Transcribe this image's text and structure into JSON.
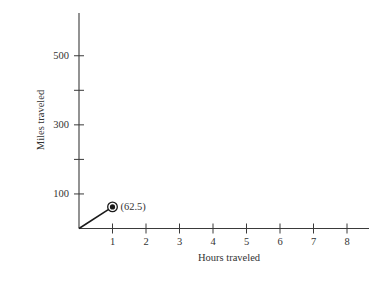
{
  "chart_data": {
    "type": "line",
    "title": "",
    "xlabel": "Hours traveled",
    "ylabel": "Miles traveled",
    "xlim": [
      0,
      8.7
    ],
    "ylim": [
      0,
      620
    ],
    "x_ticks": [
      1,
      2,
      3,
      4,
      5,
      6,
      7,
      8
    ],
    "x_tick_labels": [
      "1",
      "2",
      "3",
      "4",
      "5",
      "6",
      "7",
      "8"
    ],
    "y_ticks": [
      100,
      200,
      300,
      400,
      500
    ],
    "y_tick_labels": [
      "100",
      "",
      "300",
      "",
      "500"
    ],
    "grid": false,
    "series": [
      {
        "name": "Miles traveled",
        "x": [
          0,
          1
        ],
        "y": [
          0,
          62.5
        ],
        "marker_last": "circled-dot"
      }
    ],
    "annotations": [
      {
        "x": 1,
        "y": 62.5,
        "text": "(62.5)"
      }
    ]
  },
  "colors": {
    "axis": "#3a3a3a",
    "line": "#1a1a1a",
    "background": "#ffffff"
  }
}
